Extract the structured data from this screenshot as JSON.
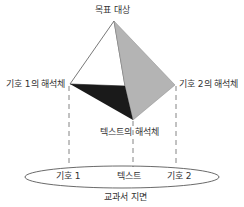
{
  "labels": {
    "target": "목표 대상",
    "sign1_interpretant": "기호 1의 해석체",
    "sign2_interpretant": "기호 2의 해석체",
    "text_interpretant": "텍스트의 해석체",
    "sign1": "기호 1",
    "text": "텍스트",
    "sign2": "기호 2",
    "textbook_page": "교과서 지면"
  },
  "colors": {
    "dark_face": "#1a1a1a",
    "gray_face": "#b4b4b4",
    "line": "#555555"
  }
}
